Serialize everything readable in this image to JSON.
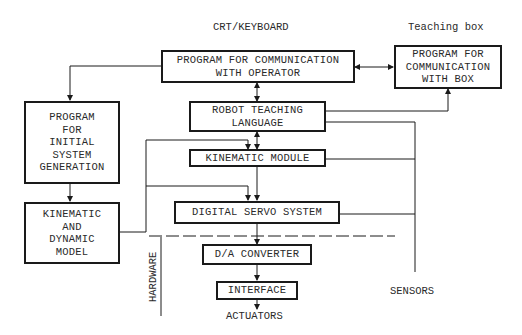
{
  "diagram": {
    "labels": {
      "crt_keyboard": "CRT/KEYBOARD",
      "teaching_box": "Teaching box",
      "sensors": "SENSORS",
      "actuators": "ACTUATORS",
      "hardware": "HARDWARE"
    },
    "boxes": {
      "comm_operator": [
        "PROGRAM FOR COMMUNICATION",
        "WITH OPERATOR"
      ],
      "comm_box": [
        "PROGRAM FOR",
        "COMMUNICATION",
        "WITH BOX"
      ],
      "teaching_language": [
        "ROBOT TEACHING",
        "LANGUAGE"
      ],
      "kinematic_module": [
        "KINEMATIC MODULE"
      ],
      "digital_servo": [
        "DIGITAL SERVO SYSTEM"
      ],
      "da_converter": [
        "D/A CONVERTER"
      ],
      "interface": [
        "INTERFACE"
      ],
      "initial_generation": [
        "PROGRAM",
        "FOR",
        "INITIAL",
        "SYSTEM",
        "GENERATION"
      ],
      "kinematic_dynamic_model": [
        "KINEMATIC",
        "AND",
        "DYNAMIC",
        "MODEL"
      ]
    },
    "colors": {
      "line": "#1a1a1a",
      "text": "#2a2a2a",
      "background": "#ffffff"
    }
  }
}
